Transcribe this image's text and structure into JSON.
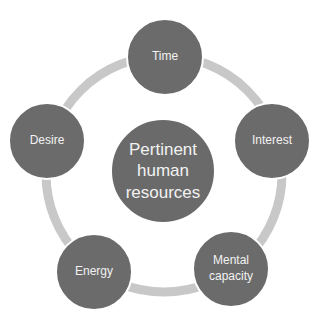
{
  "diagram": {
    "type": "cycle",
    "center": {
      "label": "Pertinent human resources"
    },
    "nodes": [
      {
        "label": "Time"
      },
      {
        "label": "Interest"
      },
      {
        "label": "Mental capacity"
      },
      {
        "label": "Energy"
      },
      {
        "label": "Desire"
      }
    ],
    "colors": {
      "node": "#6b6b6b",
      "ring": "#c8c8c8",
      "text": "#f2f2f2",
      "background": "#ffffff"
    }
  }
}
